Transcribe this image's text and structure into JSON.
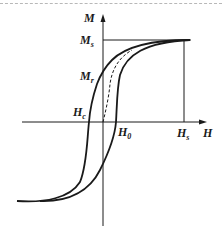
{
  "diagram": {
    "axes": {
      "x_label": "H",
      "y_label": "M"
    },
    "labels": {
      "saturation_magnetization": {
        "main": "M",
        "sub": "s"
      },
      "remanent_magnetization": {
        "main": "M",
        "sub": "r"
      },
      "coercive_field": {
        "main": "H",
        "sub": "c"
      },
      "initial_field": {
        "main": "H",
        "sub": "0"
      },
      "saturation_field": {
        "main": "H",
        "sub": "s"
      }
    },
    "curves": [
      {
        "name": "hysteresis-upper-branch",
        "style": "solid"
      },
      {
        "name": "hysteresis-lower-branch",
        "style": "solid"
      },
      {
        "name": "initial-magnetization-curve",
        "style": "dashed"
      }
    ],
    "colors": {
      "ink": "#1a1a1a",
      "background": "#ffffff",
      "border": "#b8b8b8"
    }
  }
}
